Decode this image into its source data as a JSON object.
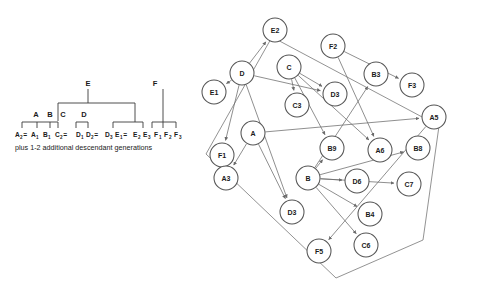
{
  "figure": {
    "title": "",
    "panels": [
      "pedigree",
      "pedigree-graph"
    ]
  },
  "pedigree": {
    "founders": [
      {
        "id": "E",
        "label": "E",
        "x": 88,
        "y": 86
      },
      {
        "id": "F",
        "label": "F",
        "x": 155,
        "y": 86
      }
    ],
    "families": [
      {
        "id": "A",
        "label": "A",
        "x": 36,
        "y": 117
      },
      {
        "id": "B",
        "label": "B",
        "x": 50,
        "y": 117
      },
      {
        "id": "C",
        "label": "C",
        "x": 63,
        "y": 117
      },
      {
        "id": "D",
        "label": "D",
        "x": 84,
        "y": 117
      }
    ],
    "leaves": [
      {
        "base": "A",
        "sub": "2",
        "eq": "=",
        "x": 15
      },
      {
        "base": "A",
        "sub": "1",
        "eq": "",
        "x": 31
      },
      {
        "base": "B",
        "sub": "1",
        "eq": "",
        "x": 43
      },
      {
        "base": "C",
        "sub": "2",
        "eq": "=",
        "x": 55
      },
      {
        "base": "D",
        "sub": "1",
        "eq": "",
        "x": 76
      },
      {
        "base": "D",
        "sub": "2",
        "eq": "=",
        "x": 86
      },
      {
        "base": "D",
        "sub": "3",
        "eq": "",
        "x": 105
      },
      {
        "base": "E",
        "sub": "1",
        "eq": "=",
        "x": 115
      },
      {
        "base": "E",
        "sub": "2",
        "eq": "",
        "x": 133
      },
      {
        "base": "E",
        "sub": "3",
        "eq": "",
        "x": 143
      },
      {
        "base": "F",
        "sub": "1",
        "eq": "",
        "x": 154
      },
      {
        "base": "F",
        "sub": "2",
        "eq": "",
        "x": 164
      },
      {
        "base": "F",
        "sub": "3",
        "eq": "",
        "x": 174
      }
    ],
    "leaf_row_text": "A₂ = A₁ B₁  C₂ = D₁ D₂ = D₃  E₁ = E₂ E₃  F₁ F₂ F₃",
    "caption": "plus 1-2 additional descendant generations",
    "caption_x": 15,
    "caption_y": 150
  },
  "graph": {
    "node_radius": 12,
    "nodes": [
      {
        "id": "E2",
        "label": "E2",
        "x": 85,
        "y": 30
      },
      {
        "id": "F2",
        "label": "F2",
        "x": 143,
        "y": 46
      },
      {
        "id": "C",
        "label": "C",
        "x": 99,
        "y": 67
      },
      {
        "id": "D",
        "label": "D",
        "x": 52,
        "y": 73
      },
      {
        "id": "B3",
        "label": "B3",
        "x": 186,
        "y": 74
      },
      {
        "id": "F3",
        "label": "F3",
        "x": 222,
        "y": 85
      },
      {
        "id": "E1",
        "label": "E1",
        "x": 24,
        "y": 92
      },
      {
        "id": "D3a",
        "label": "D3",
        "x": 145,
        "y": 94
      },
      {
        "id": "C3",
        "label": "C3",
        "x": 107,
        "y": 105
      },
      {
        "id": "A5",
        "label": "A5",
        "x": 244,
        "y": 117
      },
      {
        "id": "A",
        "label": "A",
        "x": 63,
        "y": 133
      },
      {
        "id": "B9",
        "label": "B9",
        "x": 142,
        "y": 148
      },
      {
        "id": "B8",
        "label": "B8",
        "x": 228,
        "y": 148
      },
      {
        "id": "A6",
        "label": "A6",
        "x": 190,
        "y": 150
      },
      {
        "id": "F1",
        "label": "F1",
        "x": 32,
        "y": 155
      },
      {
        "id": "A3",
        "label": "A3",
        "x": 36,
        "y": 178
      },
      {
        "id": "B",
        "label": "B",
        "x": 118,
        "y": 178
      },
      {
        "id": "D6",
        "label": "D6",
        "x": 167,
        "y": 181
      },
      {
        "id": "C7",
        "label": "C7",
        "x": 219,
        "y": 184
      },
      {
        "id": "D3b",
        "label": "D3",
        "x": 102,
        "y": 212
      },
      {
        "id": "B4",
        "label": "B4",
        "x": 180,
        "y": 214
      },
      {
        "id": "C6",
        "label": "C6",
        "x": 176,
        "y": 245
      },
      {
        "id": "F5",
        "label": "F5",
        "x": 129,
        "y": 251
      }
    ],
    "edges": [
      {
        "from": "D",
        "to": "E2"
      },
      {
        "from": "D",
        "to": "E1"
      },
      {
        "from": "C",
        "to": "C3"
      },
      {
        "from": "D",
        "to": "D3a"
      },
      {
        "from": "C",
        "to": "D3a"
      },
      {
        "from": "F2",
        "to": "F3"
      },
      {
        "from": "A",
        "to": "A3"
      },
      {
        "from": "D",
        "to": "F1"
      },
      {
        "from": "A",
        "to": "D3b"
      },
      {
        "from": "D",
        "to": "D3b"
      },
      {
        "from": "B",
        "to": "B9"
      },
      {
        "from": "C",
        "to": "B9"
      },
      {
        "from": "B",
        "to": "D6"
      },
      {
        "from": "B",
        "to": "C7"
      },
      {
        "from": "B",
        "to": "B8"
      },
      {
        "from": "A",
        "to": "A5"
      },
      {
        "from": "B",
        "to": "B4"
      },
      {
        "from": "B",
        "to": "C6"
      },
      {
        "from": "B",
        "to": "B3"
      },
      {
        "from": "F2",
        "to": "A6"
      },
      {
        "from": "C",
        "to": "A6"
      },
      {
        "from": "A5",
        "to": "F5"
      }
    ],
    "hull": "82,37 249,126 233,240 146,278 16,154"
  }
}
